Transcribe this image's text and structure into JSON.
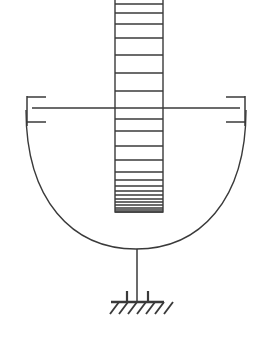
{
  "diagram": {
    "type": "engineering-schematic",
    "canvas": {
      "width": 272,
      "height": 344,
      "background": "#ffffff"
    },
    "stroke_color": "#3a3a3a",
    "parts": [
      {
        "name": "column",
        "label": "vertical hatched column"
      },
      {
        "name": "bowl",
        "label": "hemispherical bowl"
      },
      {
        "name": "beam",
        "label": "horizontal beam at rim level"
      },
      {
        "name": "bracket-left",
        "label": "left bracket end"
      },
      {
        "name": "bracket-right",
        "label": "right bracket end"
      },
      {
        "name": "stem",
        "label": "support stem"
      },
      {
        "name": "ground",
        "label": "fixed ground support"
      }
    ],
    "column": {
      "x_left": 115,
      "x_right": 163,
      "y_top": 0,
      "y_bottom": 212,
      "rungs": [
        4,
        13,
        24,
        38,
        55,
        73,
        91,
        108,
        119,
        131,
        146,
        160,
        172,
        180,
        186,
        191,
        195,
        199,
        202,
        205,
        208,
        210,
        212
      ]
    },
    "bowl": {
      "rim_y": 110,
      "left_x": 26,
      "right_x": 246,
      "bottom_y": 249,
      "center_x": 136
    },
    "beam": {
      "y": 108,
      "x_start": 32,
      "x_end": 240
    },
    "bracket_left": {
      "x": 27,
      "y_top": 96,
      "y_bottom": 126,
      "stub_top_y": 97,
      "stub_bottom_y": 122,
      "stub_length": 18
    },
    "bracket_right": {
      "x": 245,
      "y_top": 96,
      "y_bottom": 126,
      "stub_top_y": 97,
      "stub_bottom_y": 122,
      "stub_length": 18
    },
    "stem": {
      "x": 137,
      "y_top": 249,
      "y_bottom": 300
    },
    "ground": {
      "base_y": 302,
      "base_x_start": 111,
      "base_x_end": 164,
      "tick_xs": [
        127,
        148
      ],
      "tick_top_y": 291,
      "hatch_count": 7,
      "hatch_start_x": 110,
      "hatch_spacing": 9,
      "hatch_drop": 12,
      "hatch_run": 9
    }
  }
}
